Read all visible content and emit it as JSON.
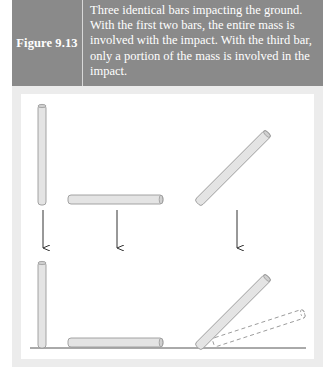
{
  "figure": {
    "label": "Figure 9.13",
    "caption": "Three identical bars impacting the ground. With the first two bars, the entire mass is involved with the impact. With the third bar, only a portion of the mass is involved in the impact.",
    "colors": {
      "caption_bg": "#8a8a8a",
      "caption_text": "#ffffff",
      "panel_bg": "#ececec",
      "bar_fill": "#e4e4e4",
      "bar_stroke": "#9a9a9a",
      "arrow": "#333333",
      "ground": "#555555"
    },
    "diagram": {
      "bars_before": [
        "vertical bar",
        "horizontal bar",
        "diagonal bar"
      ],
      "arrows": 3,
      "bars_after": [
        "vertical bar on ground",
        "horizontal bar on ground",
        "diagonal bar on ground with dashed rotated outline"
      ]
    }
  }
}
